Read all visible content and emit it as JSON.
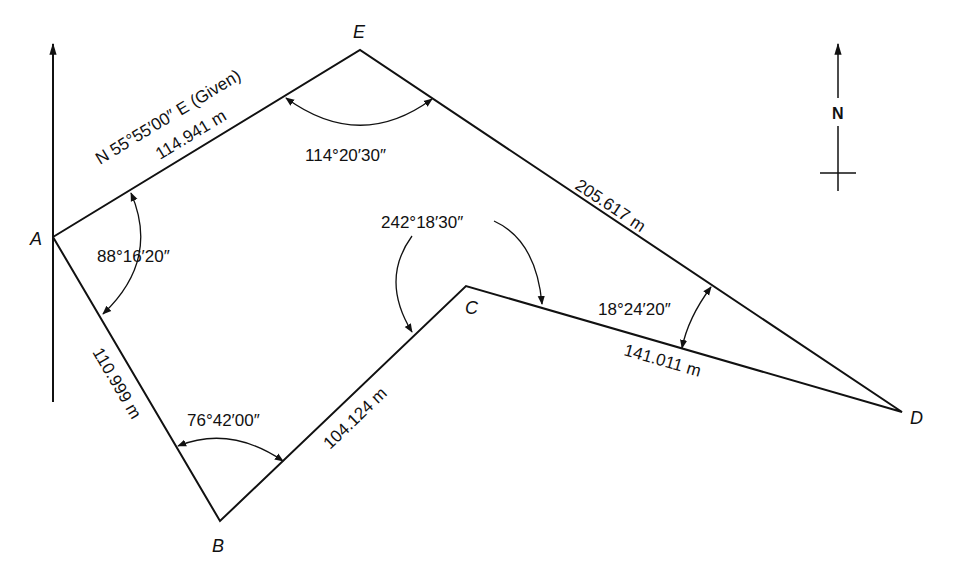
{
  "vertices": {
    "A": {
      "label": "A",
      "x": 53,
      "y": 237
    },
    "B": {
      "label": "B",
      "x": 220,
      "y": 521
    },
    "C": {
      "label": "C",
      "x": 466,
      "y": 286
    },
    "D": {
      "label": "D",
      "x": 902,
      "y": 412
    },
    "E": {
      "label": "E",
      "x": 360,
      "y": 50
    }
  },
  "sides": {
    "AE": {
      "bearing": "N 55°55′00″ E (Given)",
      "length": "114.941 m"
    },
    "ED": {
      "length": "205.617 m"
    },
    "DC": {
      "length": "141.011 m"
    },
    "CB": {
      "length": "104.124 m"
    },
    "BA": {
      "length": "110.999 m"
    }
  },
  "angles": {
    "A": "88°16′20″",
    "B": "76°42′00″",
    "C": "242°18′30″",
    "D": "18°24′20″",
    "E": "114°20′30″"
  },
  "north_arrow": {
    "label": "N"
  },
  "colors": {
    "ink": "#111111",
    "background": "#ffffff"
  }
}
